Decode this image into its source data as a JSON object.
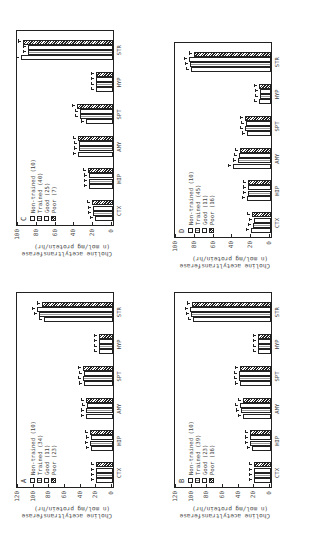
{
  "figure": {
    "ylabel_line1": "Choline acetyltransferase",
    "ylabel_line2": "(n mol/mg protein/hr)",
    "series_names": [
      "Non-trained",
      "Trained",
      "Good",
      "Poor"
    ],
    "categories": [
      "CTX",
      "HIP",
      "AMY",
      "SPT",
      "HYP",
      "STR"
    ]
  },
  "panels": {
    "A": {
      "letter": "A",
      "legend": [
        "Non-trained (10)",
        "Trained (34)",
        "Good (11)",
        "Poor (23)"
      ],
      "ymax": 120,
      "yticks": [
        "0",
        "20",
        "40",
        "60",
        "80",
        "100",
        "120"
      ]
    },
    "B": {
      "letter": "B",
      "legend": [
        "Non-trained (10)",
        "Trained (39)",
        "Good (23)",
        "Poor (16)"
      ],
      "ymax": 120,
      "yticks": [
        "0",
        "20",
        "40",
        "60",
        "80",
        "100",
        "120"
      ]
    },
    "C": {
      "letter": "C",
      "legend": [
        "Non-trained (10)",
        "Trained (40)",
        "Good (25)",
        "Poor (7)"
      ],
      "ymax": 100,
      "yticks": [
        "0",
        "20",
        "40",
        "60",
        "80",
        "100"
      ]
    },
    "D": {
      "letter": "D",
      "legend": [
        "Non-trained (10)",
        "Trained (45)",
        "Good (11)",
        "Poor (16)"
      ],
      "ymax": 100,
      "yticks": [
        "0",
        "20",
        "40",
        "60",
        "80",
        "100"
      ]
    }
  },
  "chart_data": [
    {
      "type": "bar",
      "title": "A",
      "categories": [
        "CTX",
        "HIP",
        "AMY",
        "SPT",
        "HYP",
        "STR"
      ],
      "xlabel": "",
      "ylabel": "Choline acetyltransferase (n mol/mg protein/hr)",
      "ylim": [
        0,
        120
      ],
      "series": [
        {
          "name": "Non-trained (10)",
          "values": [
            22,
            28,
            35,
            37,
            18,
            88
          ]
        },
        {
          "name": "Trained (34)",
          "values": [
            22,
            29,
            34,
            38,
            18,
            94
          ]
        },
        {
          "name": "Good (11)",
          "values": [
            22,
            28,
            33,
            37,
            18,
            97
          ]
        },
        {
          "name": "Poor (23)",
          "values": [
            22,
            29,
            34,
            38,
            18,
            91
          ]
        }
      ],
      "annotations": [
        "* above STR Good"
      ]
    },
    {
      "type": "bar",
      "title": "B",
      "categories": [
        "CTX",
        "HIP",
        "AMY",
        "SPT",
        "HYP",
        "STR"
      ],
      "xlabel": "",
      "ylabel": "Choline acetyltransferase (n mol/mg protein/hr)",
      "ylim": [
        0,
        120
      ],
      "series": [
        {
          "name": "Non-trained (10)",
          "values": [
            22,
            24,
            36,
            40,
            16,
            100
          ]
        },
        {
          "name": "Trained (39)",
          "values": [
            22,
            27,
            38,
            41,
            17,
            102
          ]
        },
        {
          "name": "Good (23)",
          "values": [
            22,
            27,
            40,
            41,
            17,
            104
          ]
        },
        {
          "name": "Poor (16)",
          "values": [
            22,
            27,
            36,
            40,
            17,
            101
          ]
        }
      ],
      "annotations": [
        "* on HIP",
        "* # on AMY"
      ]
    },
    {
      "type": "bar",
      "title": "C",
      "categories": [
        "CTX",
        "HIP",
        "AMY",
        "SPT",
        "HYP",
        "STR"
      ],
      "xlabel": "",
      "ylabel": "Choline acetyltransferase (n mol/mg protein/hr)",
      "ylim": [
        0,
        100
      ],
      "series": [
        {
          "name": "Non-trained (10)",
          "values": [
            19,
            26,
            37,
            29,
            18,
            98
          ]
        },
        {
          "name": "Trained (40)",
          "values": [
            21,
            26,
            36,
            35,
            18,
            90
          ]
        },
        {
          "name": "Good (25)",
          "values": [
            21,
            26,
            36,
            35,
            18,
            90
          ]
        },
        {
          "name": "Poor (7)",
          "values": [
            22,
            27,
            37,
            38,
            18,
            96
          ]
        }
      ],
      "annotations": [
        "* on CTX",
        "* on SPT",
        "* on STR"
      ]
    },
    {
      "type": "bar",
      "title": "D",
      "categories": [
        "CTX",
        "HIP",
        "AMY",
        "SPT",
        "HYP",
        "STR"
      ],
      "xlabel": "",
      "ylabel": "Choline acetyltransferase (n mol/mg protein/hr)",
      "ylim": [
        0,
        100
      ],
      "series": [
        {
          "name": "Non-trained (10)",
          "values": [
            21,
            26,
            40,
            26,
            13,
            85
          ]
        },
        {
          "name": "Trained (45)",
          "values": [
            19,
            24,
            35,
            28,
            12,
            86
          ]
        },
        {
          "name": "Good (11)",
          "values": [
            18,
            24,
            34,
            27,
            12,
            87
          ]
        },
        {
          "name": "Poor (16)",
          "values": [
            20,
            24,
            33,
            28,
            13,
            82
          ]
        }
      ],
      "annotations": [
        "* # on CTX",
        "* on HIP",
        "* on AMY"
      ]
    }
  ]
}
